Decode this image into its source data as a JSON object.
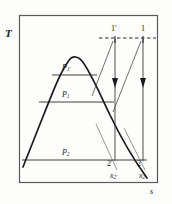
{
  "figure": {
    "type": "temperature-entropy-diagram",
    "axes": {
      "y_label": "T",
      "x_label": "s"
    },
    "frame": {
      "x": 19,
      "y": 15,
      "width": 139,
      "height": 168
    },
    "saturation_dome": {
      "label": "saturation-dome",
      "apex": {
        "x": 74,
        "y": 57
      },
      "left_foot": {
        "x": 24,
        "y": 166
      },
      "right_foot": {
        "x": 146,
        "y": 175
      }
    },
    "isobars": [
      {
        "name": "P1prime",
        "label_main": "P",
        "label_sub": "1'",
        "y": 75,
        "x_start": 52,
        "x_end": 97
      },
      {
        "name": "P1",
        "label_main": "P",
        "label_sub": "1",
        "y": 102,
        "x_start": 39,
        "x_end": 114
      },
      {
        "name": "P2",
        "label_main": "P",
        "label_sub": "2",
        "y": 160,
        "x_start": 22,
        "x_end": 147
      }
    ],
    "states": [
      {
        "name": "state-1-prime",
        "label": "1'",
        "x": 115,
        "y": 38
      },
      {
        "name": "state-1",
        "label": "1",
        "x": 143,
        "y": 38
      },
      {
        "name": "state-2-prime",
        "label": "2'",
        "x": 115,
        "y": 160
      },
      {
        "name": "state-2",
        "label": "2",
        "x": 143,
        "y": 160
      }
    ],
    "quality_labels": [
      {
        "name": "quality-x2-prime",
        "main": "x",
        "sub": "2'",
        "x": 112,
        "y": 176
      },
      {
        "name": "quality-x2",
        "main": "x",
        "sub": "2",
        "x": 140,
        "y": 176
      }
    ],
    "isotherm_dashed": {
      "y": 38,
      "x_start": 99,
      "x_end": 156
    },
    "expansion_arrows": [
      {
        "name": "expansion-1-prime-to-2-prime",
        "x": 115,
        "y_start": 38,
        "y_end": 160
      },
      {
        "name": "expansion-1-to-2",
        "x": 143,
        "y_start": 38,
        "y_end": 160
      }
    ],
    "colors": {
      "line": "#1a1a1a",
      "frame": "#555555",
      "background": "#fdfdfc"
    }
  }
}
